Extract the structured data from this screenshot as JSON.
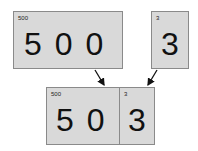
{
  "top_left_card": {
    "label": "500",
    "digits": "5 0 0"
  },
  "top_right_card": {
    "label": "3",
    "digits": "3"
  },
  "combined_card": {
    "left": {
      "label": "500",
      "digits": "5 0"
    },
    "right": {
      "label": "3",
      "digits": "3"
    }
  },
  "colors": {
    "card_fill": "#d9d9d9",
    "border": "#8a8a8a",
    "arrow": "#111111"
  }
}
